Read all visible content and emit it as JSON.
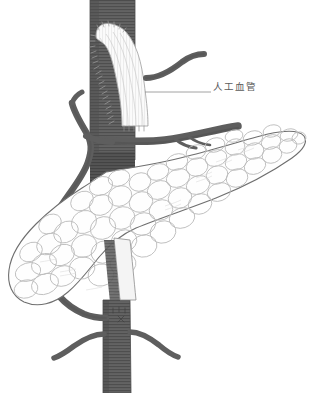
{
  "figure": {
    "background_color": "#ffffff",
    "width": 312,
    "height": 393
  },
  "annotations": [
    {
      "id": "graft-label",
      "text": "人工血管",
      "meaning": "artificial blood vessel (vascular graft)",
      "color": "#5b5b5b",
      "leader_line": {
        "x1": 145,
        "y1": 92,
        "x2": 211,
        "y2": 92,
        "color": "#8c8c8c"
      }
    }
  ],
  "structures": {
    "vein_color": "#5e5e5e",
    "vein_shadow_color": "#4a4a4a",
    "vein_hatch_color": "#3f3f3f",
    "graft_fill": "#fbfbfb",
    "graft_line_color": "#b5b5b5",
    "graft_suture_color": "#9a9a9a",
    "pancreas_fill": "#fefefe",
    "pancreas_outline": "#6f6f6f",
    "lobule_line_color": "#b9b9b9",
    "items": [
      {
        "name": "portal-vein-trunk",
        "label": "Portal vein / superior mesenteric vein trunk",
        "orientation": "vertical"
      },
      {
        "name": "vascular-graft",
        "label": "Artificial vascular graft",
        "orientation": "curved"
      },
      {
        "name": "splenic-vein",
        "label": "Splenic vein",
        "orientation": "horizontal-right"
      },
      {
        "name": "upper-right-branch",
        "label": "Upper right venous branch",
        "orientation": "right"
      },
      {
        "name": "left-collateral-vein",
        "label": "Left collateral / gastroduodenal vein",
        "orientation": "curved-left"
      },
      {
        "name": "lower-left-branch",
        "label": "Lower left tributary",
        "orientation": "left"
      },
      {
        "name": "lower-right-branch",
        "label": "Lower right tributary",
        "orientation": "right"
      },
      {
        "name": "pancreas-body",
        "label": "Pancreas (head, body and tail)",
        "orientation": "diagonal"
      }
    ]
  }
}
